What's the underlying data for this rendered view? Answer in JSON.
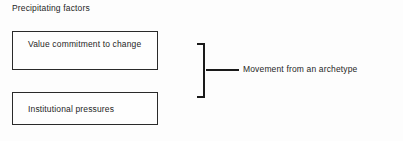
{
  "diagram": {
    "heading": "Precipitating factors",
    "factors": [
      {
        "label": "Value commitment to change"
      },
      {
        "label": "Institutional pressures"
      }
    ],
    "outcome": {
      "label": "Movement from an archetype"
    },
    "colors": {
      "background": "#fdfdfd",
      "ink": "#1f1f1f",
      "border": "#2a2a2a",
      "bracket": "#1a1a1a"
    }
  }
}
